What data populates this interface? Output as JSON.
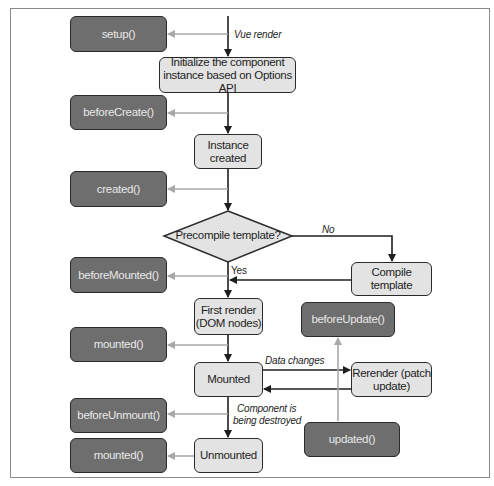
{
  "diagram": {
    "hooks": {
      "setup": "setup()",
      "before_create": "beforeCreate()",
      "created": "created()",
      "before_mounted": "beforeMounted()",
      "mounted": "mounted()",
      "before_update": "beforeUpdate()",
      "updated": "updated()",
      "before_unmount": "beforeUnmount()",
      "unmounted_hook": "mounted()"
    },
    "steps": {
      "init": "Initialize the component instance based on Options API",
      "init_line1": "Initialize the component",
      "init_line2": "instance based on Options API",
      "instance_line1": "Instance",
      "instance_line2": "created",
      "decision": "Precompile template?",
      "compile": "Compile template",
      "first_render_line1": "First render",
      "first_render_line2": "(DOM nodes)",
      "mounted": "Mounted",
      "rerender_line1": "Rerender (patch",
      "rerender_line2": "update)",
      "unmounted": "Unmounted"
    },
    "edge_labels": {
      "vue_render": "Vue render",
      "no": "No",
      "yes": "Yes",
      "data_changes": "Data changes",
      "destroy_line1": "Component is",
      "destroy_line2": "being destroyed"
    },
    "colors": {
      "hook_fill": "#6e6e6e",
      "step_fill": "#e3e3e3",
      "main_arrow": "#1e1e1e",
      "hook_arrow": "#a8a8a8"
    }
  }
}
